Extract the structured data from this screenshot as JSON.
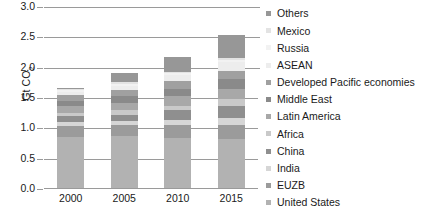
{
  "chart_data": {
    "type": "bar",
    "title": "",
    "subtitle": "",
    "xlabel": "",
    "ylabel": "Gt CO2",
    "ylabel_display": "Gt CO",
    "ylabel_subscript": "2",
    "categories": [
      "2000",
      "2005",
      "2010",
      "2015"
    ],
    "ylim": [
      0.0,
      3.0
    ],
    "ytick_labels": [
      "0.0",
      "0.5",
      "1.0",
      "1.5",
      "2.0",
      "2.5",
      "3.0"
    ],
    "ytick_values": [
      0.0,
      0.5,
      1.0,
      1.5,
      2.0,
      2.5,
      3.0
    ],
    "grid": true,
    "grid_axis": "y",
    "legend_position": "right",
    "stacked": true,
    "stack_order": "bottom-to-top",
    "totals": [
      1.65,
      1.9,
      2.16,
      2.52
    ],
    "series": [
      {
        "name": "United States",
        "color": "#b2b2b2",
        "values": [
          0.84,
          0.86,
          0.83,
          0.8
        ]
      },
      {
        "name": "EUZB",
        "color": "#9b9b9b",
        "values": [
          0.19,
          0.18,
          0.21,
          0.24
        ]
      },
      {
        "name": "India",
        "color": "#d6d6d6",
        "values": [
          0.06,
          0.06,
          0.08,
          0.11
        ]
      },
      {
        "name": "China",
        "color": "#8f8f8f",
        "values": [
          0.09,
          0.11,
          0.16,
          0.21
        ]
      },
      {
        "name": "Africa",
        "color": "#c9c9c9",
        "values": [
          0.06,
          0.07,
          0.08,
          0.1
        ]
      },
      {
        "name": "Latin America",
        "color": "#a8a8a8",
        "values": [
          0.12,
          0.13,
          0.15,
          0.17
        ]
      },
      {
        "name": "Middle East",
        "color": "#8a8a8a",
        "values": [
          0.08,
          0.1,
          0.13,
          0.17
        ]
      },
      {
        "name": "Developed Pacific economies",
        "color": "#a0a0a0",
        "values": [
          0.1,
          0.11,
          0.12,
          0.13
        ]
      },
      {
        "name": "ASEAN",
        "color": "#ededed",
        "values": [
          0.05,
          0.07,
          0.1,
          0.14
        ]
      },
      {
        "name": "Russia",
        "color": "#f2f2f2",
        "values": [
          0.02,
          0.03,
          0.03,
          0.04
        ]
      },
      {
        "name": "Mexico",
        "color": "#e3e3e3",
        "values": [
          0.02,
          0.03,
          0.03,
          0.04
        ]
      },
      {
        "name": "Others",
        "color": "#979797",
        "values": [
          0.02,
          0.15,
          0.24,
          0.37
        ]
      }
    ],
    "legend_entries_top_to_bottom": [
      "Others",
      "Mexico",
      "Russia",
      "ASEAN",
      "Developed Pacific economies",
      "Middle East",
      "Latin America",
      "Africa",
      "China",
      "India",
      "EUZB",
      "United States"
    ],
    "axis_color": "#9a9a9a",
    "text_color": "#1a1a1a",
    "background": "#ffffff"
  }
}
